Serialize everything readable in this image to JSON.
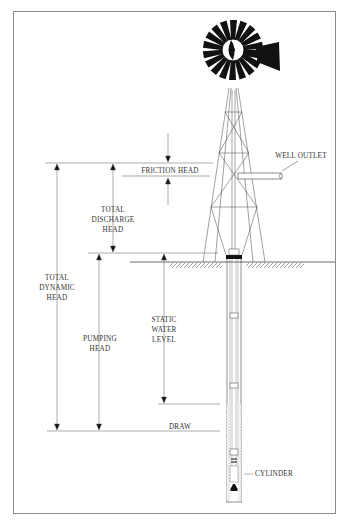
{
  "diagram": {
    "labels": {
      "friction_head": "FRICTION HEAD",
      "well_outlet": "WELL OUTLET",
      "total_discharge_head": "TOTAL\nDISCHARGE\nHEAD",
      "total_dynamic_head": "TOTAL\nDYNAMIC\nHEAD",
      "pumping_head": "PUMPING\nHEAD",
      "static_water_level": "STATIC\nWATER\nLEVEL",
      "draw": "DRAW",
      "cylinder": "CYLINDER"
    },
    "colors": {
      "line": "#444444",
      "fill": "#111111",
      "frame": "#8a8a8a",
      "text": "#333333"
    },
    "caption": ""
  }
}
